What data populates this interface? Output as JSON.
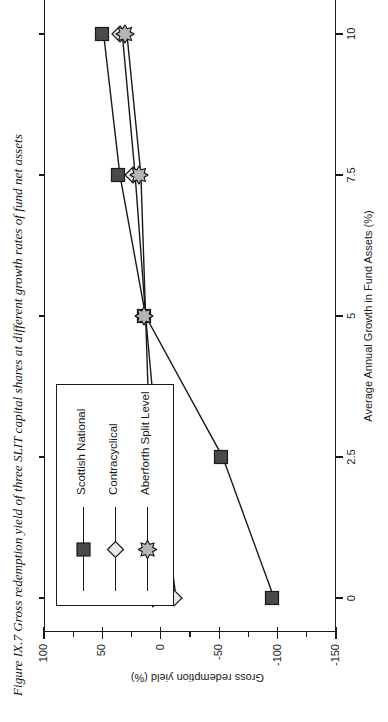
{
  "caption": "Figure IX.7  Gross redemption yield of three SLIT capital shares at different growth rates of fund net assets",
  "axes": {
    "x_title": "Average Annual Growth in Fund Assets (%)",
    "y_title": "Gross redemption yield (%)",
    "x_ticks": [
      "0",
      "2.5",
      "5",
      "7.5",
      "10"
    ],
    "y_ticks": [
      "100",
      "50",
      "0",
      "-50",
      "-100",
      "-150"
    ]
  },
  "legend": {
    "items": [
      {
        "label": "Scottish National",
        "marker": "square-marker",
        "color": "#4a4a4a"
      },
      {
        "label": "Contracyclical",
        "marker": "diamond-marker",
        "color": "#e8e8e8"
      },
      {
        "label": "Aberforth Split Level",
        "marker": "star-marker",
        "color": "#b5b5b5"
      }
    ]
  },
  "chart_data": {
    "type": "line",
    "title": "Figure IX.7  Gross redemption yield of three SLIT capital shares at different growth rates of fund net assets",
    "xlabel": "Average Annual Growth in Fund Assets (%)",
    "ylabel": "Gross redemption yield (%)",
    "x": [
      0,
      2.5,
      5,
      7.5,
      10
    ],
    "xlim": [
      -0.6,
      10.6
    ],
    "ylim": [
      -150,
      100
    ],
    "grid": false,
    "legend_position": "upper-right",
    "orientation": "rotated-90",
    "series": [
      {
        "name": "Scottish National",
        "marker": "square",
        "values": [
          -97,
          -53,
          13,
          35,
          49
        ]
      },
      {
        "name": "Contracyclical",
        "marker": "diamond",
        "values": [
          -13,
          2,
          13,
          22,
          33
        ]
      },
      {
        "name": "Aberforth Split Level",
        "marker": "star",
        "values": [
          5,
          9,
          13,
          17,
          29
        ]
      }
    ]
  }
}
